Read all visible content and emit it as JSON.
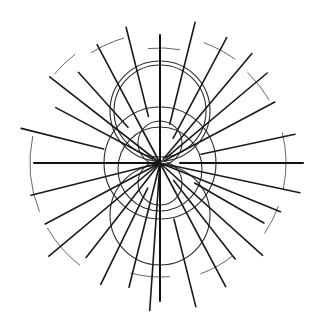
{
  "diagram": {
    "title": "",
    "colors": {
      "background": "#ffffff",
      "line": "#1a1a1a",
      "arc": "#555555"
    },
    "rays": [
      {
        "angle": 0,
        "inner": 20,
        "outer": 143
      },
      {
        "angle": 180,
        "inner": 0,
        "outer": 126
      },
      {
        "angle": 90,
        "inner": 0,
        "outer": 128
      },
      {
        "angle": 270,
        "inner": 0,
        "outer": 138
      },
      {
        "angle": 12,
        "inner": 42,
        "outer": 138
      },
      {
        "angle": 28,
        "inner": 5,
        "outer": 130
      },
      {
        "angle": 40,
        "inner": 8,
        "outer": 140
      },
      {
        "angle": 50,
        "inner": 5,
        "outer": 143
      },
      {
        "angle": 62,
        "inner": 28,
        "outer": 142
      },
      {
        "angle": 76,
        "inner": 40,
        "outer": 145
      },
      {
        "angle": 104,
        "inner": 48,
        "outer": 140
      },
      {
        "angle": 118,
        "inner": 0,
        "outer": 134
      },
      {
        "angle": 132,
        "inner": 48,
        "outer": 122
      },
      {
        "angle": 142,
        "inner": 0,
        "outer": 140
      },
      {
        "angle": 152,
        "inner": 8,
        "outer": 118
      },
      {
        "angle": 166,
        "inner": 58,
        "outer": 143
      },
      {
        "angle": 194,
        "inner": 0,
        "outer": 133
      },
      {
        "angle": 208,
        "inner": 0,
        "outer": 130
      },
      {
        "angle": 220,
        "inner": 0,
        "outer": 145
      },
      {
        "angle": 232,
        "inner": 0,
        "outer": 120
      },
      {
        "angle": 244,
        "inner": 28,
        "outer": 135
      },
      {
        "angle": 256,
        "inner": 0,
        "outer": 128
      },
      {
        "angle": 266,
        "inner": 8,
        "outer": 148
      },
      {
        "angle": 284,
        "inner": 58,
        "outer": 148
      },
      {
        "angle": 298,
        "inner": 0,
        "outer": 140
      },
      {
        "angle": 308,
        "inner": 22,
        "outer": 122
      },
      {
        "angle": 318,
        "inner": 0,
        "outer": 138
      },
      {
        "angle": 330,
        "inner": 40,
        "outer": 120
      },
      {
        "angle": 338,
        "inner": 0,
        "outer": 130
      },
      {
        "angle": 348,
        "inner": 0,
        "outer": 143
      }
    ],
    "circles": [
      {
        "id": "upper-outer",
        "cx": 0,
        "cy": -52,
        "r": 50
      },
      {
        "id": "upper-inner",
        "cx": 0,
        "cy": -52,
        "r": 46
      },
      {
        "id": "lower",
        "cx": 0,
        "cy": 52,
        "r": 50
      },
      {
        "id": "center-mid",
        "cx": 0,
        "cy": 0,
        "r": 56
      },
      {
        "id": "center-small-top",
        "cx": 0,
        "cy": -20,
        "r": 22
      },
      {
        "id": "center-small-bottom",
        "cx": 0,
        "cy": 20,
        "r": 22
      },
      {
        "id": "center-ring-bottom",
        "cx": 0,
        "cy": 6,
        "r": 42
      }
    ],
    "arcs": [
      {
        "r": 115,
        "start": 96,
        "end": 80
      },
      {
        "r": 130,
        "start": 122,
        "end": 106
      },
      {
        "r": 138,
        "start": 140,
        "end": 128
      },
      {
        "r": 130,
        "start": 202,
        "end": 168
      },
      {
        "r": 130,
        "start": 232,
        "end": 210
      },
      {
        "r": 128,
        "start": 54,
        "end": 70
      },
      {
        "r": 126,
        "start": 30,
        "end": 46
      },
      {
        "r": 126,
        "start": -12,
        "end": 14
      },
      {
        "r": 126,
        "start": 326,
        "end": 340
      },
      {
        "r": 118,
        "start": 290,
        "end": 308
      },
      {
        "r": 114,
        "start": 255,
        "end": 275
      }
    ]
  }
}
